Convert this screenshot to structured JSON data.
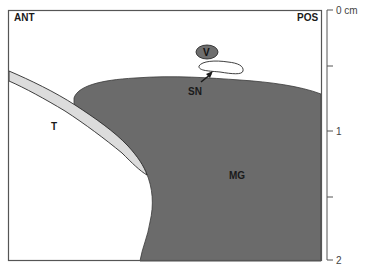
{
  "diagram": {
    "orientation_labels": {
      "left": "ANT",
      "right": "POS"
    },
    "structures": [
      {
        "id": "V",
        "label": "V",
        "fill": "#6e6e6e"
      },
      {
        "id": "SN",
        "label": "SN",
        "fill": "#ffffff"
      },
      {
        "id": "T",
        "label": "T",
        "fill": "#dcdcdc"
      },
      {
        "id": "MG",
        "label": "MG",
        "fill": "#6b6b6b"
      }
    ],
    "scale_bar": {
      "unit": "cm",
      "ticks": [
        {
          "value": "0 cm",
          "y": 10
        },
        {
          "value": "",
          "y": 66
        },
        {
          "value": "1",
          "y": 131
        },
        {
          "value": "",
          "y": 197
        },
        {
          "value": "2",
          "y": 259
        }
      ]
    },
    "colors": {
      "frame": "#555555",
      "muscle": "#6b6b6b",
      "tendon": "#dcdcdc",
      "vessel": "#6e6e6e",
      "outline": "#2a2a2a"
    }
  }
}
